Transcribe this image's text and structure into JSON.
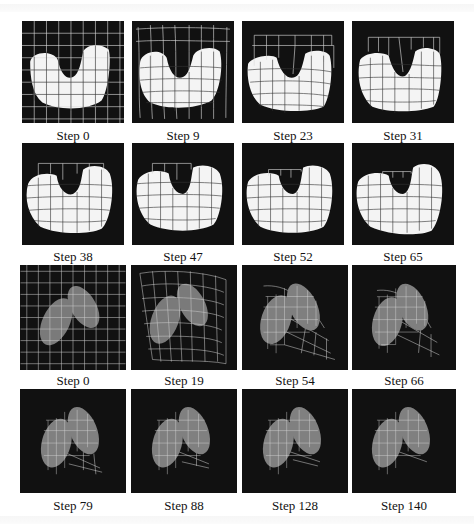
{
  "figure": {
    "sequences": [
      {
        "name": "u-shape-registration",
        "panels": [
          {
            "label": "Step 0"
          },
          {
            "label": "Step 9"
          },
          {
            "label": "Step 23"
          },
          {
            "label": "Step 31"
          },
          {
            "label": "Step 38"
          },
          {
            "label": "Step 47"
          },
          {
            "label": "Step 52"
          },
          {
            "label": "Step 65"
          }
        ]
      },
      {
        "name": "lung-registration",
        "panels": [
          {
            "label": "Step 0"
          },
          {
            "label": "Step 19"
          },
          {
            "label": "Step 54"
          },
          {
            "label": "Step 66"
          },
          {
            "label": "Step 79"
          },
          {
            "label": "Step 88"
          },
          {
            "label": "Step 128"
          },
          {
            "label": "Step 140"
          }
        ]
      }
    ],
    "colors": {
      "panel_bg": "#111111",
      "shape_white": "#f4f4f4",
      "shape_gray": "#7a7a7a",
      "grid_light": "#e8e8e8",
      "grid_dark": "#222222"
    }
  }
}
